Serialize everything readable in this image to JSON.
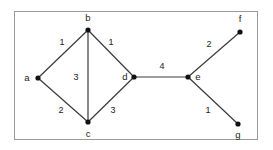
{
  "figure": {
    "kind": "weighted-undirected-graph",
    "frame": {
      "border_color": "#9b9b9b",
      "background_color": "#ffffff"
    },
    "style": {
      "edge_color": "#3a3a3a",
      "node_color": "#111111",
      "text_color": "#222222"
    }
  },
  "nodes": [
    {
      "id": "a",
      "label": "a",
      "x": 38,
      "y": 78,
      "label_x": 27,
      "label_y": 81
    },
    {
      "id": "b",
      "label": "b",
      "x": 88,
      "y": 30,
      "label_x": 88,
      "label_y": 21
    },
    {
      "id": "c",
      "label": "c",
      "x": 88,
      "y": 122,
      "label_x": 88,
      "label_y": 137
    },
    {
      "id": "d",
      "label": "d",
      "x": 134,
      "y": 77,
      "label_x": 125,
      "label_y": 80
    },
    {
      "id": "e",
      "label": "e",
      "x": 188,
      "y": 77,
      "label_x": 198,
      "label_y": 80
    },
    {
      "id": "f",
      "label": "f",
      "x": 240,
      "y": 32,
      "label_x": 240,
      "label_y": 22
    },
    {
      "id": "g",
      "label": "g",
      "x": 238,
      "y": 124,
      "label_x": 238,
      "label_y": 138
    }
  ],
  "edges": [
    {
      "id": "a-b",
      "source": "a",
      "target": "b",
      "weight": "1",
      "weight_x": 62,
      "weight_y": 45
    },
    {
      "id": "b-d",
      "source": "b",
      "target": "d",
      "weight": "1",
      "weight_x": 111,
      "weight_y": 45
    },
    {
      "id": "b-c",
      "source": "b",
      "target": "c",
      "weight": "3",
      "weight_x": 76,
      "weight_y": 80
    },
    {
      "id": "a-c",
      "source": "a",
      "target": "c",
      "weight": "2",
      "weight_x": 61,
      "weight_y": 113
    },
    {
      "id": "c-d",
      "source": "c",
      "target": "d",
      "weight": "3",
      "weight_x": 113,
      "weight_y": 113
    },
    {
      "id": "d-e",
      "source": "d",
      "target": "e",
      "weight": "4",
      "weight_x": 162,
      "weight_y": 69
    },
    {
      "id": "e-f",
      "source": "e",
      "target": "f",
      "weight": "2",
      "weight_x": 209,
      "weight_y": 47
    },
    {
      "id": "e-g",
      "source": "e",
      "target": "g",
      "weight": "1",
      "weight_x": 208,
      "weight_y": 113
    }
  ]
}
